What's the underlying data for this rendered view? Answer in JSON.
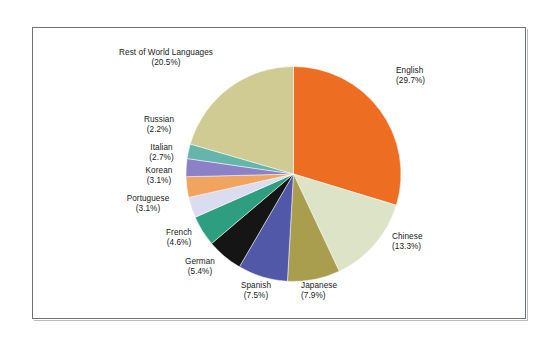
{
  "figure": {
    "background_color": "#ffffff",
    "frame_color": "#6d7276"
  },
  "chart_data": {
    "type": "pie",
    "title": "",
    "subtitle": "",
    "xlabel": "",
    "ylabel": "",
    "legend_position": "none",
    "grid": false,
    "start_angle_deg": 90,
    "direction": "clockwise",
    "units": "percent",
    "categories": [
      "English",
      "Chinese",
      "Japanese",
      "Spanish",
      "German",
      "French",
      "Portuguese",
      "Korean",
      "Italian",
      "Russian",
      "Rest of World Languages"
    ],
    "values": [
      29.7,
      13.3,
      7.9,
      7.5,
      5.4,
      4.6,
      3.1,
      3.1,
      2.7,
      2.2,
      20.5
    ],
    "colors": [
      "#ED6E22",
      "#DDE3C6",
      "#A99D4E",
      "#5258A8",
      "#151515",
      "#2E9E80",
      "#DCDCF0",
      "#F0A460",
      "#8C80C6",
      "#63B6A9",
      "#CFCB93"
    ],
    "slices": [
      {
        "label": "English",
        "value": 29.7,
        "display": "(29.7%)",
        "color": "#ED6E22"
      },
      {
        "label": "Chinese",
        "value": 13.3,
        "display": "(13.3%)",
        "color": "#DDE3C6"
      },
      {
        "label": "Japanese",
        "value": 7.9,
        "display": "(7.9%)",
        "color": "#A99D4E"
      },
      {
        "label": "Spanish",
        "value": 7.5,
        "display": "(7.5%)",
        "color": "#5258A8"
      },
      {
        "label": "German",
        "value": 5.4,
        "display": "(5.4%)",
        "color": "#151515"
      },
      {
        "label": "French",
        "value": 4.6,
        "display": "(4.6%)",
        "color": "#2E9E80"
      },
      {
        "label": "Portuguese",
        "value": 3.1,
        "display": "(3.1%)",
        "color": "#DCDCF0"
      },
      {
        "label": "Korean",
        "value": 3.1,
        "display": "(3.1%)",
        "color": "#F0A460"
      },
      {
        "label": "Italian",
        "value": 2.7,
        "display": "(2.7%)",
        "color": "#8C80C6"
      },
      {
        "label": "Russian",
        "value": 2.2,
        "display": "(2.2%)",
        "color": "#63B6A9"
      },
      {
        "label": "Rest of World Languages",
        "value": 20.5,
        "display": "(20.5%)",
        "color": "#CFCB93"
      }
    ]
  },
  "labels": {
    "english": {
      "name": "English",
      "pct": "(29.7%)"
    },
    "chinese": {
      "name": "Chinese",
      "pct": "(13.3%)"
    },
    "japanese": {
      "name": "Japanese",
      "pct": "(7.9%)"
    },
    "spanish": {
      "name": "Spanish",
      "pct": "(7.5%)"
    },
    "german": {
      "name": "German",
      "pct": "(5.4%)"
    },
    "french": {
      "name": "French",
      "pct": "(4.6%)"
    },
    "portuguese": {
      "name": "Portuguese",
      "pct": "(3.1%)"
    },
    "korean": {
      "name": "Korean",
      "pct": "(3.1%)"
    },
    "italian": {
      "name": "Italian",
      "pct": "(2.7%)"
    },
    "russian": {
      "name": "Russian",
      "pct": "(2.2%)"
    },
    "rest": {
      "name": "Rest of World Languages",
      "pct": "(20.5%)"
    }
  }
}
